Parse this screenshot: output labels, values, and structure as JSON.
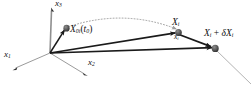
{
  "figure": {
    "background": "#ffffff",
    "ink_color": "#1a1a1a",
    "axis_color": "#8a8a8a",
    "dotted_color": "#9a9a9a",
    "tail_line_color": "#b0b0b0",
    "width": 252,
    "height": 85
  },
  "axes": {
    "origin": {
      "x": 50,
      "y": 53
    },
    "labels": [
      {
        "id": "x1",
        "base": "x",
        "sub": "1",
        "tip": {
          "x": 14,
          "y": 69
        },
        "label_pos": {
          "x": 6,
          "y": 53
        }
      },
      {
        "id": "x2",
        "base": "x",
        "sub": "2",
        "tip": {
          "x": 86,
          "y": 75
        },
        "label_pos": {
          "x": 88,
          "y": 61
        }
      },
      {
        "id": "x3",
        "base": "x",
        "sub": "3",
        "tip": {
          "x": 52,
          "y": 9
        },
        "label_pos": {
          "x": 56,
          "y": 0
        }
      }
    ]
  },
  "points": [
    {
      "id": "X0i",
      "name": "reference-position-marker",
      "x": 66,
      "y": 28
    },
    {
      "id": "Xi",
      "name": "current-position-marker",
      "x": 178,
      "y": 32
    },
    {
      "id": "XidXi",
      "name": "neighbour-position-marker",
      "x": 215,
      "y": 48
    }
  ],
  "labels": {
    "x0i": {
      "base": "X",
      "sub": "0i",
      "arg_open": "(",
      "arg_base": "t",
      "arg_sub": "0",
      "arg_close": ")",
      "pos": {
        "x": 70,
        "y": 26
      }
    },
    "xi_upper": {
      "base": "X",
      "sub": "i",
      "pos": {
        "x": 172,
        "y": 20
      }
    },
    "xi_lower": {
      "base": "x",
      "sub": "i",
      "pos": {
        "x": 174,
        "y": 33
      }
    },
    "xi_plus_dxi": {
      "base": "X",
      "sub": "i",
      "op": " + ",
      "delta": "δ",
      "base2": "X",
      "sub2": "i",
      "pos": {
        "x": 206,
        "y": 30
      }
    }
  },
  "vectors": [
    {
      "id": "origin-to-X0i",
      "name": "vector-origin-to-reference",
      "from": {
        "x": 50,
        "y": 53
      },
      "to": {
        "x": 66,
        "y": 28
      }
    },
    {
      "id": "origin-to-Xi",
      "name": "vector-origin-to-current",
      "from": {
        "x": 50,
        "y": 53
      },
      "to": {
        "x": 178,
        "y": 32
      }
    },
    {
      "id": "origin-to-XidXi",
      "name": "vector-origin-to-neighbour",
      "from": {
        "x": 50,
        "y": 53
      },
      "to": {
        "x": 215,
        "y": 48
      }
    },
    {
      "id": "Xi-to-XidXi",
      "name": "line-element-vector",
      "from": {
        "x": 178,
        "y": 33
      },
      "to": {
        "x": 214,
        "y": 47
      }
    }
  ],
  "curve": {
    "id": "particle-path",
    "name": "dotted-trajectory-arc",
    "from": {
      "x": 68,
      "y": 26
    },
    "control": {
      "x": 124,
      "y": 10
    },
    "to": {
      "x": 177,
      "y": 30
    },
    "style": "dotted"
  },
  "tail_line": {
    "id": "continuation",
    "name": "material-line-continuation",
    "from": {
      "x": 215,
      "y": 49
    },
    "to": {
      "x": 250,
      "y": 83
    }
  }
}
